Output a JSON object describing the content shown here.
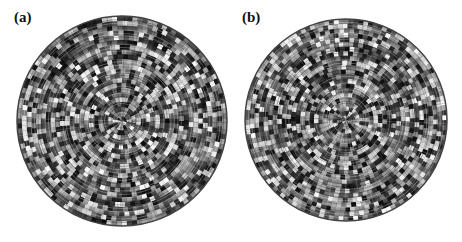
{
  "figure": {
    "panels": [
      {
        "id": "a",
        "label": "(a)",
        "cx": 122,
        "cy": 121,
        "r": 105,
        "seed": 7
      },
      {
        "id": "b",
        "label": "(b)",
        "cx": 346,
        "cy": 120,
        "r": 101,
        "seed": 19
      }
    ],
    "pattern": {
      "description": "Circular polar speckle pattern with concentric ring and radial spoke structure",
      "rings": 14,
      "spokes": 36,
      "colors": {
        "dark": "#111111",
        "light": "#f5f5f5",
        "background": "#ffffff"
      }
    }
  }
}
